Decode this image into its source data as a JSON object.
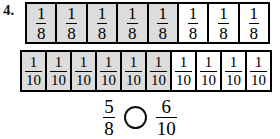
{
  "item": {
    "number_label": "4.",
    "instruction_symbol": "compare-circle"
  },
  "bars": [
    {
      "name": "eighths",
      "denominator": "8",
      "numerator_text": "1",
      "total_cells": 8,
      "shaded_cells": 5,
      "cell_labels": [
        {
          "num": "1",
          "den": "8",
          "shaded": true
        },
        {
          "num": "1",
          "den": "8",
          "shaded": true
        },
        {
          "num": "1",
          "den": "8",
          "shaded": true
        },
        {
          "num": "1",
          "den": "8",
          "shaded": true
        },
        {
          "num": "1",
          "den": "8",
          "shaded": true
        },
        {
          "num": "1",
          "den": "8",
          "shaded": false
        },
        {
          "num": "1",
          "den": "8",
          "shaded": false
        },
        {
          "num": "1",
          "den": "8",
          "shaded": false
        }
      ]
    },
    {
      "name": "tenths",
      "denominator": "10",
      "numerator_text": "1",
      "total_cells": 10,
      "shaded_cells": 6,
      "cell_labels": [
        {
          "num": "1",
          "den": "10",
          "shaded": true
        },
        {
          "num": "1",
          "den": "10",
          "shaded": true
        },
        {
          "num": "1",
          "den": "10",
          "shaded": true
        },
        {
          "num": "1",
          "den": "10",
          "shaded": true
        },
        {
          "num": "1",
          "den": "10",
          "shaded": true
        },
        {
          "num": "1",
          "den": "10",
          "shaded": true
        },
        {
          "num": "1",
          "den": "10",
          "shaded": false
        },
        {
          "num": "1",
          "den": "10",
          "shaded": false
        },
        {
          "num": "1",
          "den": "10",
          "shaded": false
        },
        {
          "num": "1",
          "den": "10",
          "shaded": false
        }
      ]
    }
  ],
  "comparison": {
    "left_fraction": {
      "numerator": "5",
      "denominator": "8"
    },
    "operator_placeholder": "",
    "right_fraction": {
      "numerator": "6",
      "denominator": "10"
    }
  },
  "colors": {
    "shade_fill": "#dcdcdc",
    "unshaded_fill": "#ffffff",
    "stroke": "#000000",
    "page_background": "#ffffff"
  }
}
